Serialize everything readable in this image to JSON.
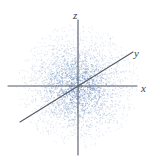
{
  "figure": {
    "title": "",
    "background_color": "#ffffff",
    "width": 160,
    "height": 160
  },
  "axes": {
    "origin": {
      "x": 78,
      "y": 86
    },
    "line_color": "#555a66",
    "line_width": 1.1,
    "items": [
      {
        "name": "z-axis",
        "label": "z",
        "label_x": 73,
        "label_y": 19,
        "x1": 78,
        "y1": 20,
        "x2": 78,
        "y2": 155
      },
      {
        "name": "x-axis",
        "label": "x",
        "label_x": 141,
        "label_y": 92,
        "x1": 8,
        "y1": 86,
        "x2": 137,
        "y2": 86
      },
      {
        "name": "y-axis",
        "label": "y",
        "label_x": 134,
        "label_y": 57,
        "x1": 20,
        "y1": 122,
        "x2": 133,
        "y2": 52
      }
    ]
  },
  "chart_data": {
    "type": "scatter",
    "title": "",
    "xlabel": "x",
    "ylabel": "y",
    "zlabel": "z",
    "grid": false,
    "legend": null,
    "point_count": 3000,
    "point_color": "#7d99c4",
    "point_size": 1,
    "distribution": "gaussian-radial",
    "center": {
      "x": 78,
      "y": 86
    },
    "sigma_px": 26,
    "max_radius_px": 62,
    "xlim": [
      -3,
      3
    ],
    "ylim": [
      -3,
      3
    ],
    "seed": 20240517
  }
}
